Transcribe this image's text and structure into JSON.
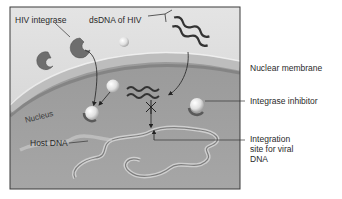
{
  "diagram": {
    "labels": {
      "hiv_integrase": "HIV integrase",
      "dsdna_of_hiv": "dsDNA of HIV",
      "nuclear_membrane": "Nuclear membrane",
      "integrase_inhibitor": "Integrase inhibitor",
      "nucleus": "Nucleus",
      "host_dna": "Host DNA",
      "integration_site_line1": "Integration",
      "integration_site_line2": "site for viral",
      "integration_site_line3": "DNA"
    },
    "colors": {
      "cytoplasm": "#d9d9d9",
      "nucleus": "#a9a9a9",
      "membrane": "#8a8a8a",
      "integrase": "#6e6e6e",
      "inhibitor": "#e6e6e6",
      "dna": "#555555",
      "frame": "#3a3a3a"
    }
  }
}
